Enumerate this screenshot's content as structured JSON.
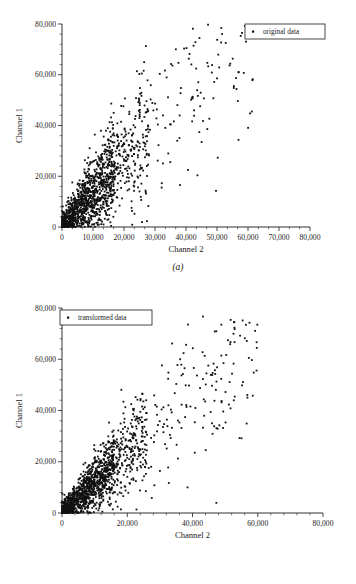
{
  "figure": {
    "panels": [
      {
        "id": "a",
        "caption": "(a)",
        "legend_label": "original data",
        "xlabel": "Channel 2",
        "ylabel": "Channel 1"
      },
      {
        "id": "b",
        "caption": "(b)",
        "legend_label": "transformed data",
        "xlabel": "Channel 2",
        "ylabel": "Channel 1"
      }
    ]
  },
  "chart_data": [
    {
      "type": "scatter",
      "panel": "a",
      "title": "",
      "xlabel": "Channel 2",
      "ylabel": "Channel 1",
      "legend": [
        "original data"
      ],
      "legend_position": "top-right",
      "grid": false,
      "xlim": [
        0,
        80000
      ],
      "ylim": [
        0,
        80000
      ],
      "xticks": [
        0,
        10000,
        20000,
        30000,
        40000,
        50000,
        60000,
        70000,
        80000
      ],
      "xtick_labels": [
        "0",
        "10,000",
        "20,000",
        "30,000",
        "40,000",
        "50,000",
        "60,000",
        "70,000",
        "80,000"
      ],
      "yticks": [
        0,
        20000,
        40000,
        60000,
        80000
      ],
      "ytick_labels": [
        "0",
        "20,000",
        "40,000",
        "60,000",
        "80,000"
      ],
      "minor_ticks_per_interval_x": 2,
      "minor_ticks_per_interval_y": 4,
      "n_points": 1500,
      "marker": "square",
      "marker_size_px": 1.8,
      "color": "#111111",
      "description": "Dense elongated cloud from origin toward upper-right; bulk of mass below Channel 2 = 30,000 and Channel 1 = 40,000, with a scattered upper tail reaching 80,000 on both axes. Positive correlation, heteroscedastic fan shape."
    },
    {
      "type": "scatter",
      "panel": "b",
      "title": "",
      "xlabel": "Channel 2",
      "ylabel": "Channel 1",
      "legend": [
        "transformed data"
      ],
      "legend_position": "top-left",
      "grid": false,
      "xlim": [
        0,
        80000
      ],
      "ylim": [
        0,
        80000
      ],
      "xticks": [
        0,
        20000,
        40000,
        60000,
        80000
      ],
      "xtick_labels": [
        "0",
        "20,000",
        "40,000",
        "60,000",
        "80,000"
      ],
      "yticks": [
        0,
        20000,
        40000,
        60000,
        80000
      ],
      "ytick_labels": [
        "0",
        "20,000",
        "40,000",
        "60,000",
        "80,000"
      ],
      "minor_ticks_per_interval_x": 4,
      "minor_ticks_per_interval_y": 4,
      "n_points": 1500,
      "marker": "square",
      "marker_size_px": 1.8,
      "color": "#111111",
      "description": "Tighter, more linear cloud along the 1:1 direction; dense near origin, thinning toward 60,000 where a cluster of points reaches about 65,000-73,000. Maximum Channel 2 near 60,000."
    }
  ]
}
